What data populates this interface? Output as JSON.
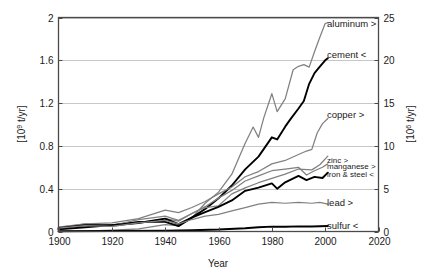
{
  "chart_data": {
    "type": "line",
    "title": "",
    "xlabel": "Year",
    "ylabel": "[10^9 t/yr]",
    "ylabel_display": "[10",
    "ylabel_sup": "9",
    "ylabel_tail": " t/yr]",
    "y2label": "[10^6 t/yr]",
    "y2label_display": "[10",
    "y2label_sup": "6",
    "y2label_tail": " t/yr]",
    "xlim": [
      1900,
      2020
    ],
    "ylim": [
      0,
      2
    ],
    "y2lim": [
      0,
      25
    ],
    "grid": true,
    "grid_axis": "y",
    "legend_position": "inline-right-labels",
    "xticks": [
      "1900",
      "1920",
      "1940",
      "1960",
      "1980",
      "2000",
      "2020"
    ],
    "xtick_values": [
      1900,
      1920,
      1940,
      1960,
      1980,
      2000,
      2020
    ],
    "yticks": [
      "0",
      "0.4",
      "0.8",
      "1.2",
      "1.6",
      "2"
    ],
    "ytick_values": [
      0,
      0.4,
      0.8,
      1.2,
      1.6,
      2
    ],
    "y2ticks": [
      "0",
      "5",
      "10",
      "15",
      "20",
      "25"
    ],
    "y2tick_values": [
      0,
      5,
      10,
      15,
      20,
      25
    ],
    "colors": {
      "left_axis_series": "#000000",
      "right_axis_series": "#808080",
      "gridline": "#b9b9b9",
      "frame": "#4a4a4a",
      "text": "#1a1a1a"
    },
    "series": [
      {
        "name": "aluminum",
        "label": "aluminum >",
        "axis": "right",
        "color": "#808080",
        "x": [
          1900,
          1910,
          1920,
          1930,
          1940,
          1945,
          1950,
          1955,
          1960,
          1965,
          1970,
          1973,
          1975,
          1977,
          1980,
          1982,
          1985,
          1988,
          1990,
          1992,
          1994,
          1996,
          1998,
          2000,
          2001
        ],
        "values": [
          0.01,
          0.05,
          0.15,
          0.3,
          0.8,
          0.7,
          1.6,
          3.3,
          4.6,
          6.7,
          10.3,
          12.2,
          11.0,
          13.3,
          16.1,
          14.0,
          15.5,
          18.9,
          19.3,
          19.5,
          19.2,
          21.0,
          22.7,
          24.3,
          24.4
        ]
      },
      {
        "name": "cement",
        "label": "cement <",
        "axis": "left",
        "color": "#000000",
        "x": [
          1900,
          1910,
          1920,
          1930,
          1940,
          1945,
          1950,
          1955,
          1960,
          1965,
          1970,
          1975,
          1980,
          1982,
          1985,
          1987,
          1990,
          1992,
          1994,
          1996,
          1998,
          2000,
          2001
        ],
        "values": [
          0.02,
          0.04,
          0.06,
          0.09,
          0.09,
          0.05,
          0.13,
          0.21,
          0.31,
          0.43,
          0.58,
          0.7,
          0.88,
          0.86,
          0.98,
          1.05,
          1.15,
          1.22,
          1.38,
          1.48,
          1.54,
          1.6,
          1.62
        ]
      },
      {
        "name": "copper",
        "label": "copper >",
        "axis": "right",
        "color": "#808080",
        "x": [
          1900,
          1910,
          1920,
          1930,
          1940,
          1945,
          1950,
          1955,
          1960,
          1965,
          1970,
          1975,
          1980,
          1985,
          1990,
          1993,
          1995,
          1997,
          1999,
          2001
        ],
        "values": [
          0.5,
          0.9,
          1.0,
          1.5,
          2.5,
          2.2,
          2.8,
          3.5,
          4.4,
          5.2,
          6.4,
          7.0,
          7.9,
          8.3,
          9.0,
          9.4,
          9.6,
          11.5,
          12.6,
          13.2
        ]
      },
      {
        "name": "zinc",
        "label": "zinc >",
        "axis": "right",
        "color": "#808080",
        "x": [
          1900,
          1910,
          1920,
          1930,
          1940,
          1945,
          1950,
          1955,
          1960,
          1965,
          1970,
          1975,
          1980,
          1985,
          1990,
          1995,
          1998,
          2001
        ],
        "values": [
          0.5,
          0.8,
          0.7,
          1.4,
          1.8,
          1.3,
          2.1,
          2.8,
          3.0,
          4.4,
          5.1,
          5.7,
          6.2,
          6.7,
          7.3,
          7.2,
          7.8,
          8.8
        ]
      },
      {
        "name": "manganese",
        "label": "manganese >",
        "axis": "right",
        "color": "#808080",
        "x": [
          1900,
          1910,
          1920,
          1930,
          1940,
          1945,
          1950,
          1955,
          1960,
          1965,
          1970,
          1975,
          1980,
          1985,
          1990,
          1993,
          1996,
          1999,
          2001
        ],
        "values": [
          0.4,
          0.9,
          0.6,
          1.0,
          1.5,
          1.2,
          2.1,
          2.9,
          3.9,
          4.8,
          5.9,
          6.5,
          7.1,
          7.3,
          7.5,
          6.6,
          7.1,
          7.5,
          7.9
        ]
      },
      {
        "name": "iron & steel",
        "label": "iron & steel <",
        "axis": "left",
        "color": "#000000",
        "x": [
          1900,
          1910,
          1920,
          1930,
          1940,
          1945,
          1950,
          1955,
          1960,
          1965,
          1970,
          1975,
          1980,
          1982,
          1985,
          1990,
          1993,
          1996,
          1999,
          2001
        ],
        "values": [
          0.03,
          0.06,
          0.06,
          0.08,
          0.12,
          0.07,
          0.13,
          0.18,
          0.23,
          0.29,
          0.38,
          0.41,
          0.45,
          0.4,
          0.46,
          0.52,
          0.48,
          0.51,
          0.5,
          0.55
        ]
      },
      {
        "name": "lead",
        "label": "lead >",
        "axis": "right",
        "color": "#808080",
        "x": [
          1900,
          1910,
          1920,
          1930,
          1940,
          1945,
          1950,
          1955,
          1960,
          1965,
          1970,
          1975,
          1980,
          1985,
          1990,
          1995,
          1998,
          2001
        ],
        "values": [
          0.4,
          0.7,
          0.6,
          1.0,
          1.3,
          0.9,
          1.4,
          1.8,
          2.0,
          2.4,
          2.8,
          3.2,
          3.4,
          3.3,
          3.4,
          3.3,
          3.4,
          3.2
        ]
      },
      {
        "name": "sulfur",
        "label": "sulfur <",
        "axis": "left",
        "color": "#000000",
        "x": [
          1900,
          1920,
          1940,
          1950,
          1960,
          1970,
          1975,
          1980,
          1985,
          1990,
          1995,
          2001
        ],
        "values": [
          0.002,
          0.004,
          0.008,
          0.012,
          0.018,
          0.03,
          0.04,
          0.046,
          0.044,
          0.048,
          0.047,
          0.052
        ]
      }
    ],
    "annotations": [
      {
        "text": "aluminum >",
        "x": 2003,
        "y_right": 24.2
      },
      {
        "text": "cement <",
        "x": 2003,
        "y_right": 20.6
      },
      {
        "text": "copper >",
        "x": 2003,
        "y_right": 13.6
      },
      {
        "text": "zinc >",
        "x": 2003,
        "y_right": 8.4
      },
      {
        "text": "manganese >",
        "x": 2003,
        "y_right": 7.6
      },
      {
        "text": "iron & steel <",
        "x": 2003,
        "y_right": 6.7
      },
      {
        "text": "lead >",
        "x": 2003,
        "y_right": 3.3
      },
      {
        "text": "sulfur <",
        "x": 2003,
        "y_right": 0.7
      }
    ]
  }
}
